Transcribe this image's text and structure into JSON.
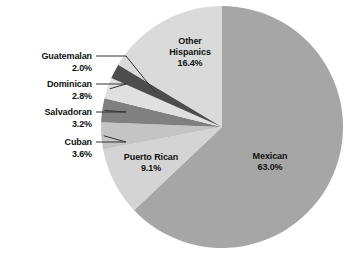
{
  "chart_data": {
    "type": "pie",
    "title": "",
    "subtitle": "",
    "xlabel": "",
    "ylabel": "",
    "grid": false,
    "legend_position": "none",
    "start_angle_deg": 0,
    "direction": "clockwise",
    "units": "percent",
    "categories": [
      "Mexican",
      "Puerto Rican",
      "Cuban",
      "Salvadoran",
      "Dominican",
      "Guatemalan",
      "Other Hispanics"
    ],
    "values": [
      63.0,
      9.1,
      3.6,
      3.2,
      2.8,
      2.0,
      16.4
    ],
    "value_labels": [
      "63.0%",
      "9.1%",
      "3.6%",
      "3.2%",
      "2.8%",
      "2.0%",
      "16.4%"
    ],
    "colors": [
      "#a6a6a6",
      "#d4d4d4",
      "#c4c4c4",
      "#808080",
      "#e0e0e0",
      "#4d4d4d",
      "#dadada"
    ],
    "slices": [
      {
        "name": "Mexican",
        "label": "Mexican",
        "value": 63.0,
        "value_label": "63.0%",
        "color": "#a6a6a6",
        "label_placement": "inside"
      },
      {
        "name": "Puerto Rican",
        "label": "Puerto Rican",
        "value": 9.1,
        "value_label": "9.1%",
        "color": "#d4d4d4",
        "label_placement": "inside"
      },
      {
        "name": "Cuban",
        "label": "Cuban",
        "value": 3.6,
        "value_label": "3.6%",
        "color": "#c4c4c4",
        "label_placement": "callout-left"
      },
      {
        "name": "Salvadoran",
        "label": "Salvadoran",
        "value": 3.2,
        "value_label": "3.2%",
        "color": "#808080",
        "label_placement": "callout-left"
      },
      {
        "name": "Dominican",
        "label": "Dominican",
        "value": 2.8,
        "value_label": "2.8%",
        "color": "#e0e0e0",
        "label_placement": "callout-left"
      },
      {
        "name": "Guatemalan",
        "label": "Guatemalan",
        "value": 2.0,
        "value_label": "2.0%",
        "color": "#4d4d4d",
        "label_placement": "callout-left"
      },
      {
        "name": "Other Hispanics",
        "label_line1": "Other",
        "label_line2": "Hispanics",
        "label": "Other Hispanics",
        "value": 16.4,
        "value_label": "16.4%",
        "color": "#dadada",
        "label_placement": "inside"
      }
    ]
  },
  "labels": {
    "mexican_name": "Mexican",
    "mexican_pct": "63.0%",
    "puerto_rican_name": "Puerto Rican",
    "puerto_rican_pct": "9.1%",
    "other_hispanics_line1": "Other",
    "other_hispanics_line2": "Hispanics",
    "other_hispanics_pct": "16.4%",
    "cuban_name": "Cuban",
    "cuban_pct": "3.6%",
    "salvadoran_name": "Salvadoran",
    "salvadoran_pct": "3.2%",
    "dominican_name": "Dominican",
    "dominican_pct": "2.8%",
    "guatemalan_name": "Guatemalan",
    "guatemalan_pct": "2.0%"
  }
}
